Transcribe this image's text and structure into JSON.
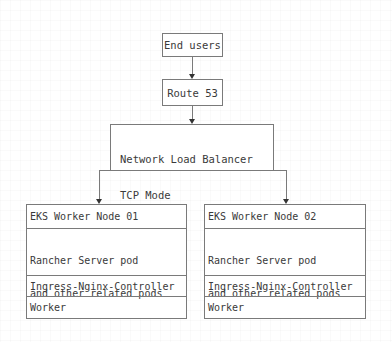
{
  "diagram": {
    "type": "architecture-flow",
    "colors": {
      "line": "#7a7a7a",
      "text": "#3a3a3a",
      "background": "#ffffff"
    },
    "end_users": {
      "label": "End users"
    },
    "route53": {
      "label": "Route 53"
    },
    "nlb": {
      "line1": "Network Load Balancer",
      "line2": "TCP Mode"
    },
    "nodes": [
      {
        "title": "EKS Worker Node 01",
        "pods_line1": "Rancher Server pod",
        "pods_line2": "and other related pods",
        "ingress": "Ingress-Nginx-Controller",
        "role": "Worker"
      },
      {
        "title": "EKS Worker Node 02",
        "pods_line1": "Rancher Server pod",
        "pods_line2": "and other related pods",
        "ingress": "Ingress-Nginx-Controller",
        "role": "Worker"
      }
    ],
    "edges": [
      {
        "from": "End users",
        "to": "Route 53"
      },
      {
        "from": "Route 53",
        "to": "Network Load Balancer TCP Mode"
      },
      {
        "from": "Network Load Balancer TCP Mode",
        "to": "EKS Worker Node 01"
      },
      {
        "from": "Network Load Balancer TCP Mode",
        "to": "EKS Worker Node 02"
      }
    ]
  }
}
